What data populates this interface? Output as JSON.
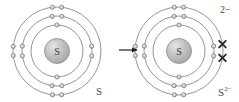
{
  "diagram": {
    "type": "bohr-model-electron-transfer",
    "arrow": {
      "name": "reaction-arrow",
      "direction": "right",
      "x": 119,
      "y": 50,
      "length": 18
    },
    "colors": {
      "ring_stroke": "#7a7a7a",
      "nucleus_fill": "#b8b8b8",
      "nucleus_highlight": "#e0e0e0",
      "nucleus_stroke": "#8a8a8a",
      "electron_fill": "#c9c9c9",
      "electron_stroke": "#6f6f6f",
      "added_electron": "#2b2b2b",
      "text": "#4a4a4a",
      "background": "#ffffff"
    },
    "atoms": [
      {
        "id": "atom-left",
        "label": "S",
        "nucleus_symbol": "S",
        "cx": 57,
        "cy": 51,
        "charge": "",
        "shells": [
          {
            "n": 1,
            "radius": 26,
            "electrons": 2,
            "angles": [
              270,
              90
            ]
          },
          {
            "n": 2,
            "radius": 35,
            "electrons": 8,
            "angles": [
              262,
              278,
              82,
              98,
              172,
              188,
              352,
              8
            ]
          },
          {
            "n": 3,
            "radius": 44,
            "electrons": 6,
            "angles": [
              264,
              276,
              84,
              96,
              174,
              186
            ]
          }
        ],
        "added_electrons": []
      },
      {
        "id": "atom-right",
        "label": "S",
        "label_superscript": "2−",
        "nucleus_symbol": "S",
        "cx": 179,
        "cy": 51,
        "charge": "2−",
        "shells": [
          {
            "n": 1,
            "radius": 26,
            "electrons": 2,
            "angles": [
              270,
              90
            ]
          },
          {
            "n": 2,
            "radius": 35,
            "electrons": 8,
            "angles": [
              262,
              278,
              82,
              98,
              172,
              188,
              352,
              8
            ]
          },
          {
            "n": 3,
            "radius": 44,
            "electrons": 6,
            "angles": [
              264,
              276,
              84,
              96,
              174,
              186
            ]
          }
        ],
        "added_electrons": [
          {
            "shell": 3,
            "angle": 351,
            "marker": "x"
          },
          {
            "shell": 3,
            "angle": 9,
            "marker": "x"
          }
        ]
      }
    ]
  },
  "labels": {
    "atom_left": "S",
    "atom_right_base": "S",
    "atom_right_sup": "2−",
    "charge_badge": "2−"
  }
}
